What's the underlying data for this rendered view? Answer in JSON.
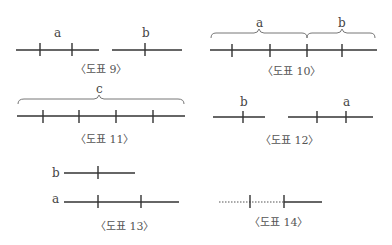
{
  "figures": [
    {
      "id": "fig9",
      "caption": "〈도표 9〉",
      "labels": {
        "a": "a",
        "b": "b"
      }
    },
    {
      "id": "fig10",
      "caption": "〈도표 10〉",
      "labels": {
        "a": "a",
        "b": "b"
      }
    },
    {
      "id": "fig11",
      "caption": "〈도표 11〉",
      "labels": {
        "c": "c"
      }
    },
    {
      "id": "fig12",
      "caption": "〈도표 12〉",
      "labels": {
        "b": "b",
        "a": "a"
      }
    },
    {
      "id": "fig13",
      "caption": "〈도표 13〉",
      "labels": {
        "b": "b",
        "a": "a"
      }
    },
    {
      "id": "fig14",
      "caption": "〈도표 14〉",
      "labels": {}
    }
  ],
  "colors": {
    "line": "#333333",
    "brace": "#777777",
    "text": "#444444"
  }
}
